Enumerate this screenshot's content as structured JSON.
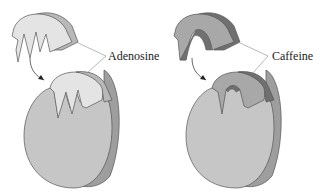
{
  "diagram": {
    "panels": [
      {
        "id": "adenosine",
        "label": "Adenosine",
        "description": "Adenosine molecule fits into receptor binding site",
        "colors": {
          "ligand_face": "#e4e4e4",
          "ligand_side": "#b8b8b8",
          "receptor_face": "#c6c6c6",
          "receptor_side": "#9e9e9e",
          "outline": "#555555"
        }
      },
      {
        "id": "caffeine",
        "label": "Caffeine",
        "description": "Caffeine molecule occupies the same receptor binding site",
        "colors": {
          "ligand_face": "#a8a8a8",
          "ligand_side": "#707070",
          "receptor_face": "#c6c6c6",
          "receptor_side": "#9e9e9e",
          "outline": "#555555"
        }
      }
    ]
  }
}
